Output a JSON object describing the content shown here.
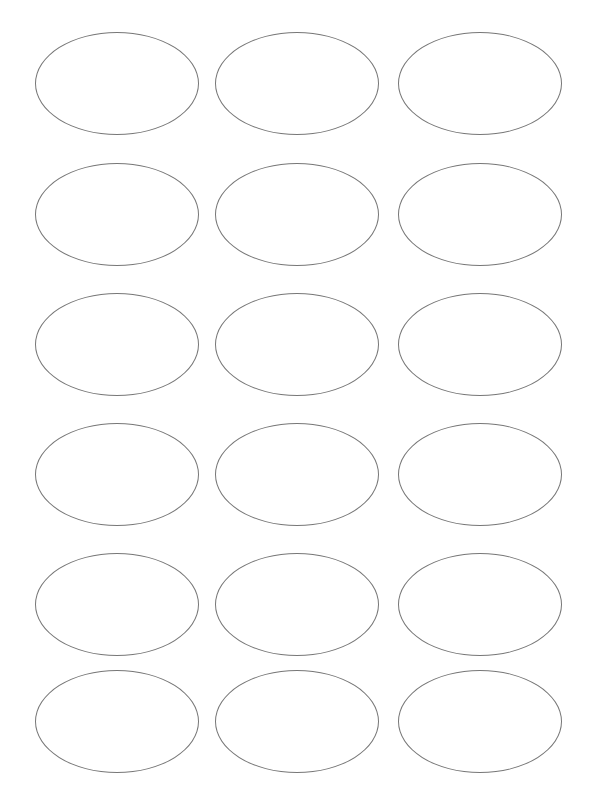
{
  "page": {
    "background_color": "#ffffff",
    "width_px": 598,
    "height_px": 810
  },
  "sheet": {
    "type": "blank-oval-label-template",
    "rows": 6,
    "columns": 3,
    "label_count": 18,
    "label_shape": "oval",
    "outline_color": "#777777",
    "outline_width_px": 1,
    "fill_color": "#ffffff",
    "label_width_px": 164,
    "label_height_px": 103,
    "column_left_px": [
      35,
      215,
      398
    ],
    "row_top_px": [
      32,
      163,
      293,
      423,
      553,
      670
    ],
    "margin_left_px": 35,
    "margin_top_px": 32,
    "margin_right_px": 36,
    "margin_bottom_px": 38,
    "horizontal_gap_px": 16,
    "vertical_gap_px": 27
  },
  "labels": [
    {
      "id": "label-r1c1",
      "row": 1,
      "column": 1,
      "text": ""
    },
    {
      "id": "label-r1c2",
      "row": 1,
      "column": 2,
      "text": ""
    },
    {
      "id": "label-r1c3",
      "row": 1,
      "column": 3,
      "text": ""
    },
    {
      "id": "label-r2c1",
      "row": 2,
      "column": 1,
      "text": ""
    },
    {
      "id": "label-r2c2",
      "row": 2,
      "column": 2,
      "text": ""
    },
    {
      "id": "label-r2c3",
      "row": 2,
      "column": 3,
      "text": ""
    },
    {
      "id": "label-r3c1",
      "row": 3,
      "column": 1,
      "text": ""
    },
    {
      "id": "label-r3c2",
      "row": 3,
      "column": 2,
      "text": ""
    },
    {
      "id": "label-r3c3",
      "row": 3,
      "column": 3,
      "text": ""
    },
    {
      "id": "label-r4c1",
      "row": 4,
      "column": 1,
      "text": ""
    },
    {
      "id": "label-r4c2",
      "row": 4,
      "column": 2,
      "text": ""
    },
    {
      "id": "label-r4c3",
      "row": 4,
      "column": 3,
      "text": ""
    },
    {
      "id": "label-r5c1",
      "row": 5,
      "column": 1,
      "text": ""
    },
    {
      "id": "label-r5c2",
      "row": 5,
      "column": 2,
      "text": ""
    },
    {
      "id": "label-r5c3",
      "row": 5,
      "column": 3,
      "text": ""
    },
    {
      "id": "label-r6c1",
      "row": 6,
      "column": 1,
      "text": ""
    },
    {
      "id": "label-r6c2",
      "row": 6,
      "column": 2,
      "text": ""
    },
    {
      "id": "label-r6c3",
      "row": 6,
      "column": 3,
      "text": ""
    }
  ]
}
